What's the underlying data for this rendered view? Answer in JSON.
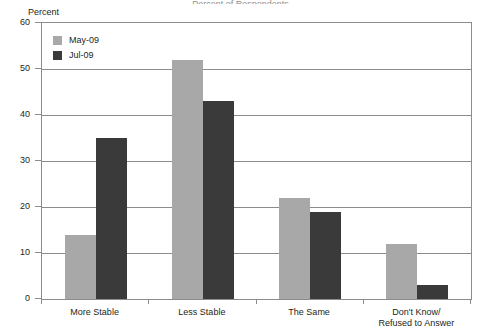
{
  "title_sliver": "Percent of Respondents",
  "axis_unit_label": "Percent",
  "legend": {
    "position": "top-left-inside",
    "items": [
      {
        "label": "May-09",
        "color": "#a8a8a8"
      },
      {
        "label": "Jul-09",
        "color": "#3a3a3a"
      }
    ]
  },
  "chart_data": {
    "type": "bar",
    "title": "",
    "xlabel": "",
    "ylabel": "Percent",
    "ylim": [
      0,
      60
    ],
    "yticks": [
      0,
      10,
      20,
      30,
      40,
      50,
      60
    ],
    "ytick_labels": [
      "0",
      "10",
      "20",
      "30",
      "40",
      "50",
      "60"
    ],
    "grid": true,
    "legend_position": "top-left-inside",
    "categories": [
      "More Stable",
      "Less Stable",
      "The Same",
      "Don't Know/\nRefused to Answer"
    ],
    "series": [
      {
        "name": "May-09",
        "color": "#a8a8a8",
        "values": [
          14,
          52,
          22,
          12
        ]
      },
      {
        "name": "Jul-09",
        "color": "#3a3a3a",
        "values": [
          35,
          43,
          19,
          3
        ]
      }
    ]
  },
  "colors": {
    "axis": "#8c8c8c",
    "grid": "#8c8c8c",
    "text": "#231f20",
    "background": "#ffffff"
  }
}
